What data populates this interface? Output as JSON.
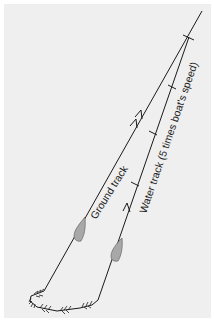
{
  "diagram": {
    "labels": {
      "ground_track": "Ground track",
      "water_track": "Water track  (5 times boat's speed)"
    },
    "colors": {
      "background": "#efefef",
      "line": "#1a1a1a",
      "boat_fill": "#a8a8a8"
    },
    "elements": [
      {
        "name": "ground-track-line",
        "desc": "Ground track line with two forward arrows"
      },
      {
        "name": "water-track-line",
        "desc": "Water track line with tick marks at intervals and one forward arrow"
      },
      {
        "name": "boat-ground-track",
        "desc": "Boat shape on ground track"
      },
      {
        "name": "boat-water-track",
        "desc": "Boat shape on water track"
      },
      {
        "name": "turn-loop",
        "desc": "Turning loop at bottom with feathered arrows"
      }
    ]
  }
}
